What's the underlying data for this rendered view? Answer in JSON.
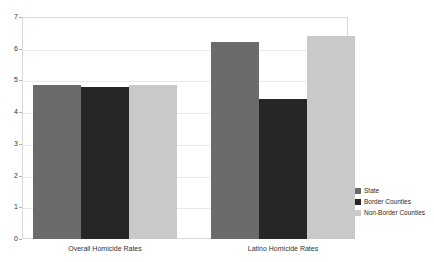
{
  "chart_data": {
    "type": "bar",
    "title": "",
    "xlabel": "",
    "ylabel": "",
    "ylim": [
      0,
      7
    ],
    "ytick_labels": [
      "7",
      "6",
      "5",
      "4",
      "3",
      "2",
      "1",
      "0"
    ],
    "ytick_values": [
      7,
      6,
      5,
      4,
      3,
      2,
      1,
      0
    ],
    "grid": true,
    "legend_position": "right",
    "categories": [
      "Overall Homicide Rates",
      "Latino Homicide Rates"
    ],
    "series": [
      {
        "name": "State",
        "color": "#6b6b6b",
        "values": [
          4.85,
          6.2
        ]
      },
      {
        "name": "Border Counties",
        "color": "#262626",
        "values": [
          4.8,
          4.4
        ]
      },
      {
        "name": "Non-Border Counties",
        "color": "#c9c9c9",
        "values": [
          4.85,
          6.4
        ]
      }
    ]
  },
  "legend": {
    "items": [
      {
        "label": "State",
        "color": "#6b6b6b"
      },
      {
        "label": "Border Counties",
        "color": "#262626"
      },
      {
        "label": "Non-Border Counties",
        "color": "#c9c9c9"
      }
    ]
  }
}
